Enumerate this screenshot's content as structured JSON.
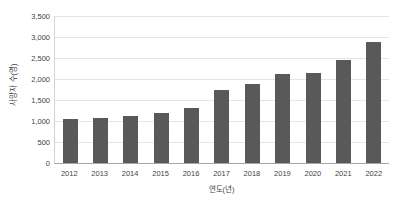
{
  "chart_data": {
    "type": "bar",
    "title": "",
    "subtitle": "",
    "xlabel": "연도(년)",
    "ylabel": "사망자 수(명)",
    "categories": [
      "2012",
      "2013",
      "2014",
      "2015",
      "2016",
      "2017",
      "2018",
      "2019",
      "2020",
      "2021",
      "2022"
    ],
    "values": [
      1050,
      1080,
      1130,
      1200,
      1320,
      1750,
      1880,
      2130,
      2150,
      2450,
      2880
    ],
    "series": [
      {
        "name": "사망자 수",
        "values": [
          1050,
          1080,
          1130,
          1200,
          1320,
          1750,
          1880,
          2130,
          2150,
          2450,
          2880
        ]
      }
    ],
    "ylim": [
      0,
      3500
    ],
    "ytick_step": 500,
    "ytick_labels": [
      "0",
      "500",
      "1,000",
      "1,500",
      "2,000",
      "2,500",
      "3,000",
      "3,500"
    ],
    "ytick_values": [
      0,
      500,
      1000,
      1500,
      2000,
      2500,
      3000,
      3500
    ],
    "grid": true,
    "grid_axis": "y",
    "legend": false,
    "legend_position": "none",
    "annotations": [],
    "colors": {
      "bar": "#595959",
      "gridline": "#e4e4e4",
      "axis_line": "#a6a6a6",
      "text": "#3f3f3f",
      "background": "#ffffff"
    }
  }
}
